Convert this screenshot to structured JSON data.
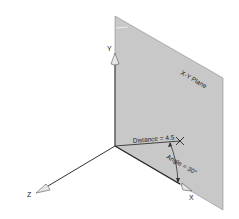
{
  "diagram": {
    "plane_label": "X-Y Plane",
    "axes": {
      "x_label": "X",
      "y_label": "Y",
      "z_label": "Z"
    },
    "distance_label": "Distance = 4.5",
    "angle_label": "Angle = 30°"
  },
  "colors": {
    "plane_fill": "#c8c8c8",
    "plane_edge": "#555555",
    "axis_line": "#333333",
    "arrow_fill": "#e6e6e6",
    "text": "#222222"
  }
}
